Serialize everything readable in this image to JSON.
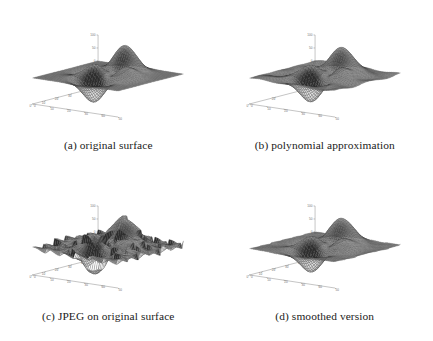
{
  "figure": {
    "background": "#ffffff",
    "layout": {
      "rows": 2,
      "cols": 2
    },
    "mesh_color": "#333333",
    "axis_color": "#8a8a8a",
    "tick_color": "#707070"
  },
  "panels": [
    {
      "id": "panel-a",
      "caption": "(a) original surface",
      "surface": "original",
      "axes": {
        "z_ticks": [
          "100",
          "50",
          "0",
          "-50",
          "-100"
        ],
        "z_values": [
          100,
          50,
          0,
          -50,
          -100
        ],
        "x_ticks": [
          "0",
          "10",
          "20",
          "30",
          "40",
          "50"
        ],
        "x_values": [
          0,
          10,
          20,
          30,
          40,
          50
        ],
        "y_ticks": [
          "50",
          "40",
          "30",
          "20",
          "10",
          "0"
        ],
        "y_values": [
          50,
          40,
          30,
          20,
          10,
          0
        ],
        "zlim": [
          -100,
          100
        ],
        "xlim": [
          0,
          50
        ],
        "ylim": [
          0,
          50
        ]
      }
    },
    {
      "id": "panel-b",
      "caption": "(b) polynomial approximation",
      "surface": "polynomial",
      "axes": {
        "z_ticks": [
          "100",
          "50",
          "0",
          "-50",
          "-100"
        ],
        "z_values": [
          100,
          50,
          0,
          -50,
          -100
        ],
        "x_ticks": [
          "0",
          "10",
          "20",
          "30",
          "40",
          "50"
        ],
        "x_values": [
          0,
          10,
          20,
          30,
          40,
          50
        ],
        "y_ticks": [
          "50",
          "40",
          "20",
          "0"
        ],
        "y_values": [
          50,
          40,
          20,
          0
        ],
        "zlim": [
          -100,
          100
        ],
        "xlim": [
          0,
          50
        ],
        "ylim": [
          0,
          50
        ]
      }
    },
    {
      "id": "panel-c",
      "caption": "(c) JPEG on original surface",
      "surface": "jpeg",
      "axes": {
        "z_ticks": [
          "100",
          "50",
          "0",
          "-50",
          "-100"
        ],
        "z_values": [
          100,
          50,
          0,
          -50,
          -100
        ],
        "x_ticks": [
          "0",
          "10",
          "20",
          "30",
          "40",
          "50"
        ],
        "x_values": [
          0,
          10,
          20,
          30,
          40,
          50
        ],
        "y_ticks": [
          "50",
          "40",
          "30",
          "20",
          "10",
          "0"
        ],
        "y_values": [
          50,
          40,
          30,
          20,
          10,
          0
        ],
        "zlim": [
          -100,
          100
        ],
        "xlim": [
          0,
          50
        ],
        "ylim": [
          0,
          50
        ]
      }
    },
    {
      "id": "panel-d",
      "caption": "(d) smoothed version",
      "surface": "smoothed",
      "axes": {
        "z_ticks": [
          "100",
          "50",
          "0",
          "-50",
          "-100"
        ],
        "z_values": [
          100,
          50,
          0,
          -50,
          -100
        ],
        "x_ticks": [
          "0",
          "10",
          "20",
          "30",
          "40",
          "50"
        ],
        "x_values": [
          0,
          10,
          20,
          30,
          40,
          50
        ],
        "y_ticks": [
          "50",
          "40",
          "30",
          "20",
          "10",
          "0"
        ],
        "y_values": [
          50,
          40,
          30,
          20,
          10,
          0
        ],
        "zlim": [
          -100,
          100
        ],
        "xlim": [
          0,
          50
        ],
        "ylim": [
          0,
          50
        ]
      }
    }
  ],
  "chart_data": {
    "type": "surface",
    "title": "",
    "xlabel": "",
    "ylabel": "",
    "zlabel": "",
    "grid": false,
    "legend": "none",
    "projection": {
      "azimuth": -37.5,
      "elevation": 30
    },
    "grid_size": {
      "nx": 49,
      "ny": 49
    },
    "xlim": [
      0,
      50
    ],
    "ylim": [
      0,
      50
    ],
    "zlim": [
      -100,
      100
    ],
    "z_tick_labels": [
      "100",
      "50",
      "0",
      "-50",
      "-100"
    ],
    "x_tick_labels": [
      "0",
      "10",
      "20",
      "30",
      "40",
      "50"
    ],
    "y_tick_labels": [
      "50",
      "40",
      "30",
      "20",
      "10",
      "0"
    ],
    "series": [
      {
        "name": "(a) original surface",
        "description": "Smooth peaks-style surface: two large positive lobes, one deep negative trough, amplitude scaled to +/-100.",
        "amplitude": 100,
        "noise": 0.0,
        "blocky": 0.0,
        "smooth_passes": 0,
        "harmonic": 0.0,
        "peaks": [
          {
            "x": 16,
            "y": 33,
            "z": 78
          },
          {
            "x": 30,
            "y": 20,
            "z": -88
          },
          {
            "x": 40,
            "y": 36,
            "z": 30
          },
          {
            "x": 10,
            "y": 14,
            "z": -22
          }
        ]
      },
      {
        "name": "(b) polynomial approximation",
        "description": "Polynomial fit of the original surface; lobes flattened and ridges broadened with extra mid-frequency ripple.",
        "amplitude": 92,
        "noise": 0.0,
        "blocky": 0.0,
        "smooth_passes": 0,
        "harmonic": 0.42,
        "peaks": [
          {
            "x": 18,
            "y": 32,
            "z": 70
          },
          {
            "x": 31,
            "y": 21,
            "z": -80
          },
          {
            "x": 41,
            "y": 35,
            "z": 34
          },
          {
            "x": 11,
            "y": 15,
            "z": -26
          }
        ]
      },
      {
        "name": "(c) JPEG on original surface",
        "description": "Original surface after JPEG compression; visible 8x8 blocking artifacts and high-frequency ringing.",
        "amplitude": 100,
        "noise": 0.0,
        "blocky": 1.0,
        "smooth_passes": 0,
        "harmonic": 0.16,
        "peaks": [
          {
            "x": 16,
            "y": 33,
            "z": 78
          },
          {
            "x": 30,
            "y": 20,
            "z": -88
          },
          {
            "x": 40,
            "y": 36,
            "z": 30
          },
          {
            "x": 10,
            "y": 14,
            "z": -22
          }
        ]
      },
      {
        "name": "(d) smoothed version",
        "description": "JPEG surface after smoothing; blocking artifacts largely removed, mild residual ripple remains.",
        "amplitude": 100,
        "noise": 0.0,
        "blocky": 0.34,
        "smooth_passes": 3,
        "harmonic": 0.12,
        "peaks": [
          {
            "x": 16,
            "y": 33,
            "z": 78
          },
          {
            "x": 30,
            "y": 20,
            "z": -88
          },
          {
            "x": 40,
            "y": 36,
            "z": 30
          },
          {
            "x": 10,
            "y": 14,
            "z": -22
          }
        ]
      }
    ]
  }
}
